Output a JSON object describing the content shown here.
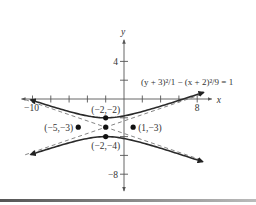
{
  "chart_data": {
    "type": "line",
    "title": "",
    "equation_label": "(y + 3)²/1 − (x + 2)²/9 = 1",
    "xlabel": "x",
    "ylabel": "y",
    "xlim": [
      -10.5,
      9.5
    ],
    "ylim": [
      -9,
      6
    ],
    "grid": false,
    "x_ticks": [
      -10,
      -8,
      -6,
      -4,
      -2,
      2,
      4,
      6,
      8
    ],
    "x_tick_labels": [
      {
        "value": -10,
        "label": "−10"
      },
      {
        "value": 8,
        "label": "8"
      }
    ],
    "y_ticks": [
      4,
      2,
      -2,
      -4,
      -6,
      -8
    ],
    "y_tick_labels": [
      {
        "value": 4,
        "label": "4"
      },
      {
        "value": -8,
        "label": "−8"
      }
    ],
    "hyperbola": {
      "h": -2,
      "k": -3,
      "a2": 1,
      "b2": 9,
      "orientation": "vertical",
      "x_range": [
        -10.2,
        8.7
      ]
    },
    "asymptotes": [
      {
        "name": "y = -3 + (x+2)/3",
        "slope": 0.3333,
        "intercept_point": [
          -2,
          -3
        ]
      },
      {
        "name": "y = -3 - (x+2)/3",
        "slope": -0.3333,
        "intercept_point": [
          -2,
          -3
        ]
      }
    ],
    "points": [
      {
        "x": -2,
        "y": -2,
        "label": "(−2,−2)",
        "label_pos": "above"
      },
      {
        "x": -2,
        "y": -3,
        "label": "",
        "label_pos": "none"
      },
      {
        "x": -2,
        "y": -4,
        "label": "(−2,−4)",
        "label_pos": "below"
      },
      {
        "x": -5,
        "y": -3,
        "label": "(−5,−3)",
        "label_pos": "left"
      },
      {
        "x": 1,
        "y": -3,
        "label": "(1,−3)",
        "label_pos": "right"
      }
    ]
  }
}
